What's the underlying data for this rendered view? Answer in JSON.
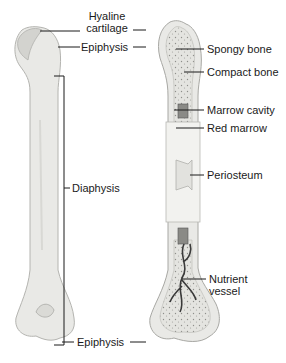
{
  "diagram": {
    "type": "anatomical-labeled-illustration",
    "left_labels": {
      "hyaline_line1": "Hyaline",
      "hyaline_line2": "cartilage",
      "epiphysis_top": "Epiphysis",
      "diaphysis": "Diaphysis",
      "epiphysis_bottom": "Epiphysis"
    },
    "right_labels": {
      "spongy": "Spongy bone",
      "compact": "Compact bone",
      "marrow_cavity": "Marrow cavity",
      "red_marrow": "Red marrow",
      "periosteum": "Periosteum",
      "nutrient_line1": "Nutrient",
      "nutrient_line2": "vessel"
    },
    "colors": {
      "bone": "#e9e9e6",
      "bone_shade": "#d6d6d2",
      "cartilage": "#cfcfcb",
      "spongy": "#dcdcd8",
      "marrow": "#8a8a86",
      "vessel": "#3a3a3a",
      "leader": "#1a1a1a"
    }
  }
}
